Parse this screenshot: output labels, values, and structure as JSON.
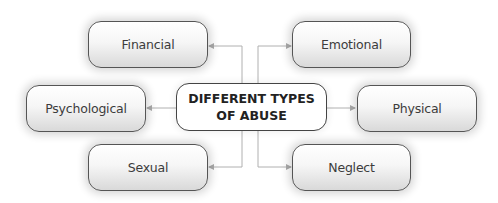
{
  "diagram": {
    "central": {
      "line1": "DIFFERENT TYPES",
      "line2": "OF ABUSE"
    },
    "types": [
      {
        "label": "Financial"
      },
      {
        "label": "Emotional"
      },
      {
        "label": "Psychological"
      },
      {
        "label": "Physical"
      },
      {
        "label": "Sexual"
      },
      {
        "label": "Neglect"
      }
    ],
    "colors": {
      "border": "#555555",
      "connector": "#aaaaaa",
      "text": "#3c3c3c"
    }
  }
}
